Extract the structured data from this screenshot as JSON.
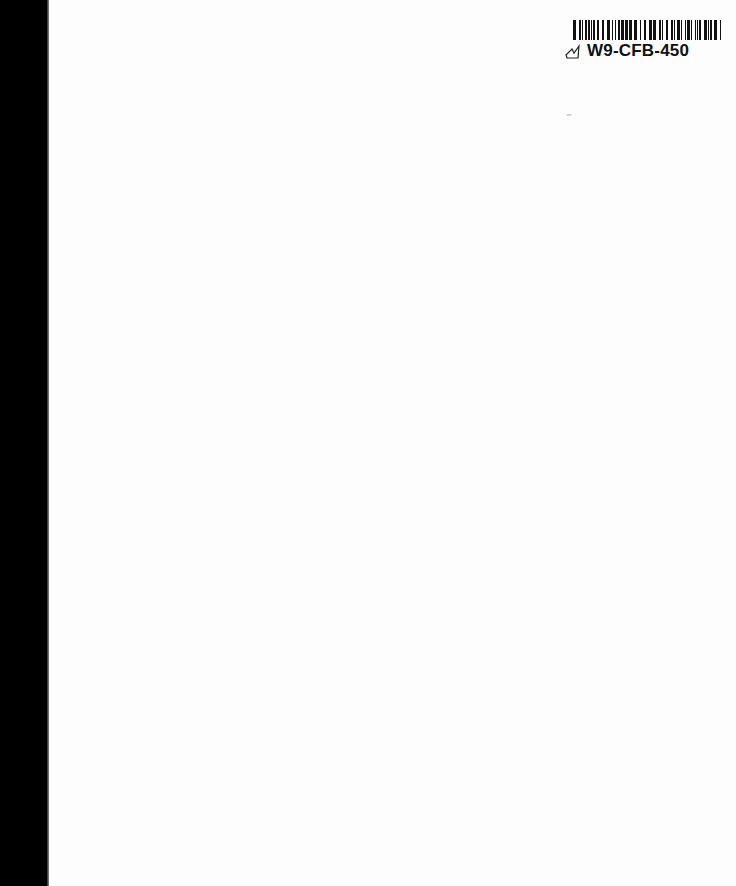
{
  "document": {
    "type": "scanned blank page",
    "background_color": "#fdfdfd",
    "margin_color": "#000000"
  },
  "label": {
    "barcode_text": "W9-CFB-450",
    "icon": "handwritten-check-mark-icon"
  }
}
